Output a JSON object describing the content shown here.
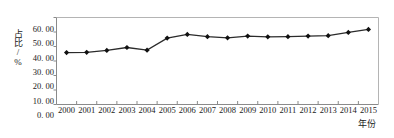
{
  "chart_data": {
    "type": "line",
    "title": "",
    "subtitle": "",
    "xlabel": "年份",
    "ylabel": "占比/%",
    "categories": [
      "2000",
      "2001",
      "2002",
      "2003",
      "2004",
      "2005",
      "2006",
      "2007",
      "2008",
      "2009",
      "2010",
      "2011",
      "2012",
      "2013",
      "2014",
      "2015"
    ],
    "values": [
      35.8,
      36.0,
      37.3,
      39.3,
      37.5,
      45.8,
      48.3,
      46.8,
      46.0,
      47.2,
      46.7,
      46.8,
      47.2,
      47.5,
      49.7,
      51.8
    ],
    "series": [
      {
        "name": "占比",
        "values": [
          35.8,
          36.0,
          37.3,
          39.3,
          37.5,
          45.8,
          48.3,
          46.8,
          46.0,
          47.2,
          46.7,
          46.8,
          47.2,
          47.5,
          49.7,
          51.8
        ]
      }
    ],
    "ylim": [
      0,
      60
    ],
    "ytick_labels": [
      "0. 00",
      "10. 00",
      "20. 00",
      "30. 00",
      "40. 00",
      "50. 00",
      "60. 00"
    ],
    "ytick_values": [
      0,
      10,
      20,
      30,
      40,
      50,
      60
    ],
    "grid": false,
    "legend": "none",
    "marker": "diamond",
    "line_color": "#2b2b2b",
    "marker_color": "#111111",
    "axis_color": "#8a8a8a",
    "background": "#ffffff"
  }
}
